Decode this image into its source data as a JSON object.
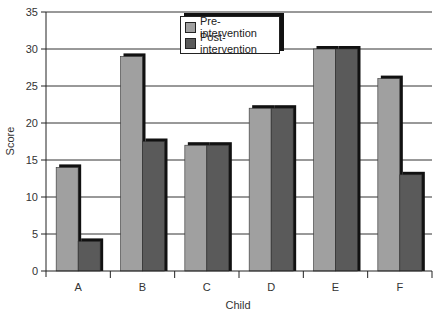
{
  "chart_data": {
    "type": "bar",
    "title": "",
    "xlabel": "Child",
    "ylabel": "Score",
    "categories": [
      "A",
      "B",
      "C",
      "D",
      "E",
      "F"
    ],
    "series": [
      {
        "name": "Pre-intervention",
        "values": [
          14,
          29,
          17,
          22,
          30,
          26
        ],
        "color": "#a0a0a0"
      },
      {
        "name": "Post-intervention",
        "values": [
          4,
          17.5,
          17,
          22,
          30,
          13
        ],
        "color": "#5a5a5a"
      }
    ],
    "ylim": [
      0,
      35
    ],
    "yticks": [
      0,
      5,
      10,
      15,
      20,
      25,
      30,
      35
    ],
    "grid": true,
    "legend_position": "top-center"
  },
  "legend": {
    "pre_label": "Pre-intervention",
    "post_label": "Post-intervention"
  },
  "axes": {
    "x_title": "Child",
    "y_title": "Score"
  }
}
